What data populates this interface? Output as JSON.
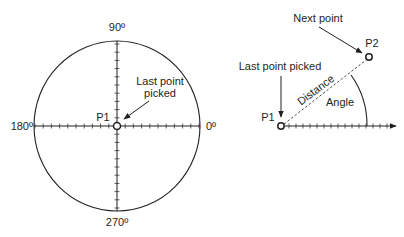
{
  "left_diagram": {
    "labels": {
      "deg_90": "90º",
      "deg_180": "180º",
      "deg_0": "0º",
      "deg_270": "270º",
      "p1": "P1",
      "last_point_line1": "Last point",
      "last_point_line2": "picked"
    }
  },
  "right_diagram": {
    "labels": {
      "next_point": "Next point",
      "p2": "P2",
      "last_point_picked": "Last point picked",
      "p1": "P1",
      "distance": "Distance",
      "angle": "Angle"
    }
  },
  "colors": {
    "stroke": "#231f20",
    "background": "#ffffff"
  }
}
